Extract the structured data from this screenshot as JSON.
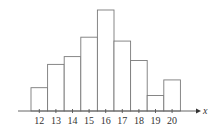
{
  "chart_data": {
    "type": "bar",
    "title": "",
    "xlabel": "x",
    "ylabel": "",
    "categories": [
      "12",
      "13",
      "14",
      "15",
      "16",
      "17",
      "18",
      "19",
      "20"
    ],
    "values": [
      3,
      6,
      7,
      9.5,
      13,
      9,
      6.5,
      2,
      4
    ],
    "ylim": [
      0,
      13
    ],
    "grid": false,
    "legend": null,
    "y_axis_shown": false,
    "bar_style": "histogram, adjacent outlined bars, no fill"
  },
  "colors": {
    "bar_stroke": "#7a7a7a",
    "bar_fill": "#ffffff",
    "axis": "#555555",
    "text": "#333333"
  }
}
